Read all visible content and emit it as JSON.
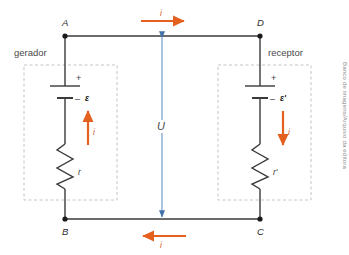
{
  "diagram": {
    "colors": {
      "wire": "#3a3a3a",
      "current_arrow": "#e4601e",
      "voltage_arrow": "#6f9dc9",
      "dashed_box": "#b9b9b9",
      "text": "#3b3b3b"
    },
    "nodes": [
      {
        "id": "A",
        "label": "A",
        "x": 65,
        "y": 33
      },
      {
        "id": "D",
        "label": "D",
        "x": 260,
        "y": 33
      },
      {
        "id": "B",
        "label": "B",
        "x": 65,
        "y": 222
      },
      {
        "id": "C",
        "label": "C",
        "x": 260,
        "y": 222
      }
    ],
    "boxes": [
      {
        "id": "gerador",
        "label": "gerador",
        "label_x": 14,
        "label_y": 50
      },
      {
        "id": "receptor",
        "label": "receptor",
        "label_x": 272,
        "label_y": 50
      }
    ],
    "branches": [
      {
        "id": "left-branch",
        "emf_label": "ε",
        "plus_sign": "+",
        "minus_sign": "–",
        "resistor_label": "r",
        "current_label": "i",
        "current_direction": "up"
      },
      {
        "id": "right-branch",
        "emf_label": "ε'",
        "plus_sign": "+",
        "minus_sign": "–",
        "resistor_label": "r'",
        "current_label": "i",
        "current_direction": "down"
      }
    ],
    "top_current": {
      "label": "i",
      "direction": "right"
    },
    "bottom_current": {
      "label": "i",
      "direction": "left"
    },
    "voltage": {
      "label": "U"
    },
    "credit": "Banco de imagens/Arquivo da editora"
  }
}
